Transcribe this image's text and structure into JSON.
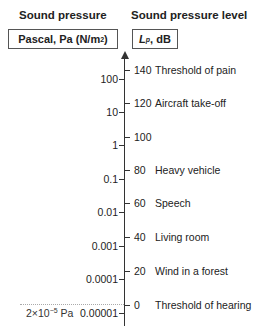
{
  "left": {
    "header": "Sound pressure",
    "unit_box": "Pascal, Pa (N/m",
    "unit_sup": "2",
    "unit_close": ")"
  },
  "right": {
    "header": "Sound pressure level",
    "unit_sym": "L",
    "unit_sub": "p",
    "unit_rest": ", dB"
  },
  "reference": {
    "prefix": "2×10",
    "exp": "−5",
    "suffix": " Pa"
  },
  "pa_ticks": [
    {
      "label": "100",
      "y": 79
    },
    {
      "label": "10",
      "y": 112
    },
    {
      "label": "1",
      "y": 145
    },
    {
      "label": "0.1",
      "y": 179
    },
    {
      "label": "0.01",
      "y": 212
    },
    {
      "label": "0.001",
      "y": 246
    },
    {
      "label": "0.0001",
      "y": 279
    },
    {
      "label": "0.00001",
      "y": 313
    }
  ],
  "db_ticks": [
    {
      "value": "140",
      "desc": "Threshold of pain",
      "y": 70
    },
    {
      "value": "120",
      "desc": "Aircraft take-off",
      "y": 103
    },
    {
      "value": "100",
      "desc": "",
      "y": 137
    },
    {
      "value": "80",
      "desc": "Heavy vehicle",
      "y": 170
    },
    {
      "value": "60",
      "desc": "Speech",
      "y": 203
    },
    {
      "value": "40",
      "desc": "Living room",
      "y": 237
    },
    {
      "value": "20",
      "desc": "Wind in a forest",
      "y": 271
    },
    {
      "value": "0",
      "desc": "Threshold of hearing",
      "y": 305
    }
  ]
}
